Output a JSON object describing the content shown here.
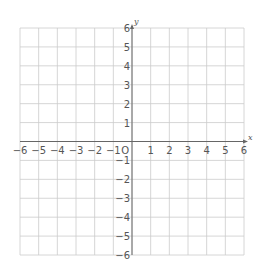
{
  "diagram": {
    "type": "coordinate-grid",
    "x_axis": {
      "label": "x",
      "min": -6,
      "max": 6,
      "ticks": [
        "−6",
        "−5",
        "−4",
        "−3",
        "−2",
        "−1",
        "1",
        "2",
        "3",
        "4",
        "5",
        "6"
      ]
    },
    "y_axis": {
      "label": "y",
      "min": -6,
      "max": 6,
      "ticks": [
        "6",
        "5",
        "4",
        "3",
        "2",
        "1",
        "−1",
        "−2",
        "−3",
        "−4",
        "−5",
        "−6"
      ]
    },
    "origin_label": "O",
    "colors": {
      "grid": "#cccccc",
      "axis": "#666666",
      "text": "#555555"
    }
  }
}
